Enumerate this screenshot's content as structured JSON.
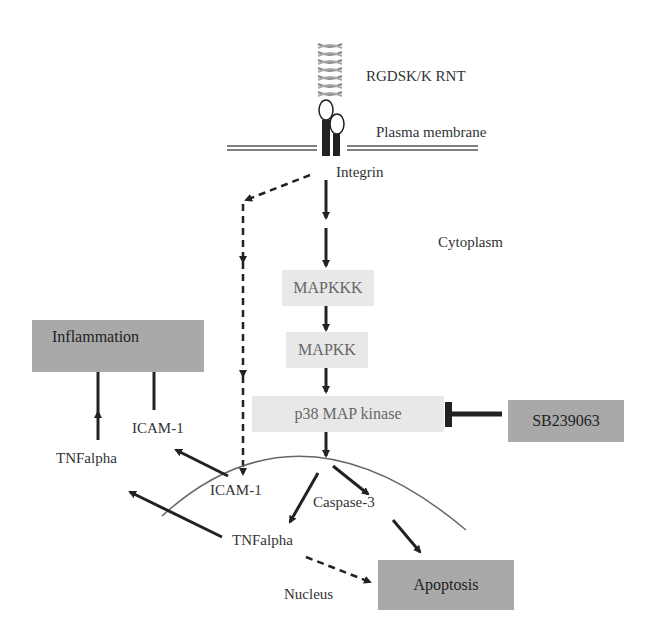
{
  "diagram": {
    "type": "signaling-pathway",
    "labels": {
      "ligand": "RGDSK/K RNT",
      "membrane": "Plasma membrane",
      "receptor": "Integrin",
      "compartment_cytoplasm": "Cytoplasm",
      "compartment_nucleus": "Nucleus",
      "icam_outside": "ICAM-1",
      "tnf_outside": "TNFalpha",
      "icam_nucleus": "ICAM-1",
      "tnf_nucleus": "TNFalpha",
      "caspase": "Caspase-3"
    },
    "boxes": {
      "mapkkk": "MAPKKK",
      "mapkk": "MAPKK",
      "p38": "p38 MAP kinase",
      "inhibitor": "SB239063",
      "inflammation": "Inflammation",
      "apoptosis": "Apoptosis"
    },
    "edges": [
      {
        "from": "Integrin",
        "to": "MAPKKK",
        "style": "solid"
      },
      {
        "from": "MAPKKK",
        "to": "MAPKK",
        "style": "solid"
      },
      {
        "from": "MAPKK",
        "to": "p38 MAP kinase",
        "style": "solid"
      },
      {
        "from": "SB239063",
        "to": "p38 MAP kinase",
        "style": "inhibition"
      },
      {
        "from": "p38 MAP kinase",
        "to": "Nucleus",
        "style": "solid"
      },
      {
        "from": "Integrin",
        "to": "ICAM-1 (nucleus)",
        "style": "dashed"
      },
      {
        "from": "Nucleus",
        "to": "TNFalpha (nucleus)",
        "style": "solid"
      },
      {
        "from": "Nucleus",
        "to": "Caspase-3",
        "style": "solid"
      },
      {
        "from": "Caspase-3",
        "to": "Apoptosis",
        "style": "solid"
      },
      {
        "from": "TNFalpha (nucleus)",
        "to": "Apoptosis",
        "style": "dashed"
      },
      {
        "from": "ICAM-1 (nucleus)",
        "to": "ICAM-1",
        "style": "solid"
      },
      {
        "from": "TNFalpha (nucleus)",
        "to": "TNFalpha",
        "style": "solid"
      },
      {
        "from": "ICAM-1",
        "to": "Inflammation",
        "style": "solid"
      },
      {
        "from": "TNFalpha",
        "to": "Inflammation",
        "style": "solid"
      }
    ]
  }
}
